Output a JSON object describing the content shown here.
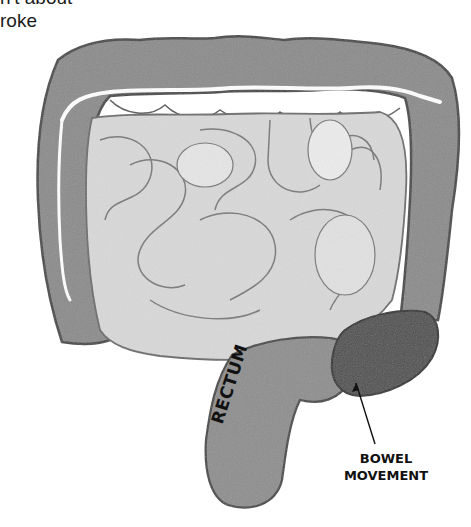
{
  "caption": {
    "line1": "n't about",
    "line2": "roke"
  },
  "diagram": {
    "style": "grayscale watercolor",
    "labels": {
      "rectum": "RECTUM",
      "bowel_movement_line1": "BOWEL",
      "bowel_movement_line2": "MOVEMENT"
    },
    "colors": {
      "colon": "#8a8a8a",
      "colon_outline": "#4a4a4a",
      "small_intestine": "#d6d6d6",
      "small_intestine_highlight": "#ececec",
      "stool": "#4e4e4e",
      "background": "#ffffff"
    }
  }
}
